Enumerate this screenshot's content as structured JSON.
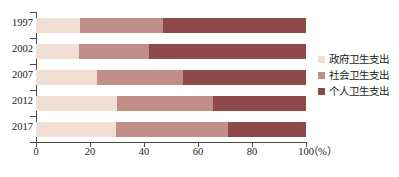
{
  "chart_data": {
    "type": "bar",
    "orientation": "horizontal",
    "stacked": true,
    "title": "",
    "xlabel": "(%)",
    "ylabel": "",
    "xlim": [
      0,
      100
    ],
    "xticks": [
      0,
      20,
      40,
      60,
      80,
      100
    ],
    "xtick_labels": [
      "0",
      "20",
      "40",
      "60",
      "80",
      "100"
    ],
    "x_unit_label": "（%）",
    "categories": [
      "1997",
      "2002",
      "2007",
      "2012",
      "2017"
    ],
    "grid": false,
    "legend_position": "right",
    "series": [
      {
        "name": "政府卫生支出",
        "color": "#f1ded5",
        "values": [
          16.3,
          15.9,
          22.7,
          30.0,
          29.6
        ]
      },
      {
        "name": "社会卫生支出",
        "color": "#c28e88",
        "values": [
          30.8,
          26.1,
          31.7,
          35.6,
          41.4
        ]
      },
      {
        "name": "个人卫生支出",
        "color": "#8e4a4a",
        "values": [
          52.9,
          58.0,
          45.6,
          34.4,
          29.0
        ]
      }
    ]
  },
  "legend": {
    "items": [
      {
        "label": "政府卫生支出",
        "color": "#f1ded5"
      },
      {
        "label": "社会卫生支出",
        "color": "#c28e88"
      },
      {
        "label": "个人卫生支出",
        "color": "#8e4a4a"
      }
    ]
  },
  "axis": {
    "x_unit": "（%）",
    "ticks": [
      "0",
      "20",
      "40",
      "60",
      "80",
      "100"
    ]
  },
  "years": [
    "1997",
    "2002",
    "2007",
    "2012",
    "2017"
  ],
  "caption": ""
}
